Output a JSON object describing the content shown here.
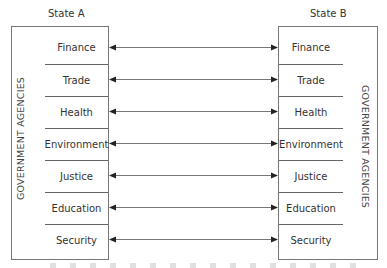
{
  "diagram": {
    "left_state": {
      "title": "State A",
      "side_label": "GOVERNMENT AGENCIES",
      "agencies": [
        "Finance",
        "Trade",
        "Health",
        "Environment",
        "Justice",
        "Education",
        "Security"
      ]
    },
    "right_state": {
      "title": "State B",
      "side_label": "GOVERNMENT AGENCIES",
      "agencies": [
        "Finance",
        "Trade",
        "Health",
        "Environment",
        "Justice",
        "Education",
        "Security"
      ]
    },
    "connections": "bidirectional arrows linking each matching agency",
    "colors": {
      "line": "#666666",
      "text": "#333333",
      "background": "#ffffff"
    }
  }
}
